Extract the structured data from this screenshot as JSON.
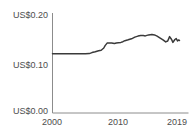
{
  "chart_data": {
    "type": "line",
    "title": "",
    "xlabel": "",
    "ylabel": "",
    "x": [
      2000,
      2000.5,
      2001,
      2001.5,
      2002,
      2002.5,
      2003,
      2003.5,
      2004,
      2004.5,
      2005,
      2005.6,
      2006,
      2006.5,
      2007,
      2007.4,
      2007.8,
      2008.0,
      2008.3,
      2008.6,
      2009,
      2009.4,
      2009.7,
      2010,
      2010.4,
      2010.7,
      2011,
      2011.5,
      2012,
      2012.5,
      2013,
      2013.4,
      2013.8,
      2014.1,
      2014.6,
      2015.1,
      2015.5,
      2015.9,
      2016.3,
      2016.8,
      2017.2,
      2017.5,
      2017.8,
      2018.1,
      2018.3,
      2018.6,
      2018.8,
      2019.0,
      2019.15,
      2019.3
    ],
    "series": [
      {
        "name": "value in US dollars",
        "values": [
          0.121,
          0.121,
          0.121,
          0.121,
          0.121,
          0.121,
          0.121,
          0.121,
          0.121,
          0.121,
          0.121,
          0.1215,
          0.1235,
          0.1252,
          0.1272,
          0.1285,
          0.133,
          0.138,
          0.143,
          0.1435,
          0.1435,
          0.1425,
          0.1435,
          0.144,
          0.1445,
          0.146,
          0.148,
          0.15,
          0.152,
          0.1555,
          0.1575,
          0.159,
          0.1585,
          0.158,
          0.16,
          0.161,
          0.16,
          0.1575,
          0.154,
          0.15,
          0.1455,
          0.1475,
          0.1565,
          0.1505,
          0.1445,
          0.1505,
          0.1525,
          0.1475,
          0.1495,
          0.1485
        ]
      }
    ],
    "xlim": [
      2000,
      2020.7
    ],
    "ylim": [
      0,
      0.2
    ],
    "grid": false,
    "legend": "none",
    "y_ticks": [
      0.2,
      0.1,
      0.0
    ],
    "y_tick_labels": [
      "US$0.20",
      "US$0.10",
      "US$0.00"
    ],
    "x_ticks": [
      2000,
      2010,
      2019
    ],
    "x_tick_labels": [
      "2000",
      "2010",
      "2019"
    ],
    "line_color": "#3a3a3a",
    "axis_color": "#8c8c8c",
    "label_color": "#4d4d4d"
  }
}
